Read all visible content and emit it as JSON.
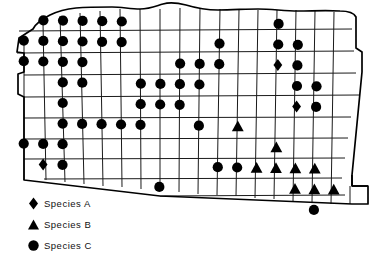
{
  "figure": {
    "kind": "species-distribution-map"
  },
  "legend": {
    "items": [
      {
        "symbol": "diamond",
        "label": "Species A"
      },
      {
        "symbol": "triangle",
        "label": "Species B"
      },
      {
        "symbol": "circle",
        "label": "Species C"
      }
    ]
  },
  "colors": {
    "symbol": "#000000",
    "grid": "#1a1a1a",
    "outline": "#000000",
    "background": "#ffffff"
  },
  "chart_data": {
    "type": "map",
    "title": "",
    "grid": {
      "columns": 17,
      "rows": 10
    },
    "symbol_key": {
      "diamond": "Species A",
      "triangle": "Species B",
      "circle": "Species C"
    },
    "markers": [
      {
        "row": 1,
        "col": 2,
        "symbol": "circle"
      },
      {
        "row": 1,
        "col": 3,
        "symbol": "circle"
      },
      {
        "row": 1,
        "col": 4,
        "symbol": "circle"
      },
      {
        "row": 1,
        "col": 5,
        "symbol": "circle"
      },
      {
        "row": 1,
        "col": 6,
        "symbol": "circle"
      },
      {
        "row": 1,
        "col": 14,
        "symbol": "circle"
      },
      {
        "row": 2,
        "col": 1,
        "symbol": "circle"
      },
      {
        "row": 2,
        "col": 2,
        "symbol": "circle"
      },
      {
        "row": 2,
        "col": 3,
        "symbol": "circle"
      },
      {
        "row": 2,
        "col": 4,
        "symbol": "circle"
      },
      {
        "row": 2,
        "col": 5,
        "symbol": "circle"
      },
      {
        "row": 2,
        "col": 6,
        "symbol": "circle"
      },
      {
        "row": 2,
        "col": 11,
        "symbol": "circle"
      },
      {
        "row": 2,
        "col": 14,
        "symbol": "circle"
      },
      {
        "row": 2,
        "col": 15,
        "symbol": "circle"
      },
      {
        "row": 3,
        "col": 1,
        "symbol": "circle"
      },
      {
        "row": 3,
        "col": 2,
        "symbol": "circle"
      },
      {
        "row": 3,
        "col": 3,
        "symbol": "circle"
      },
      {
        "row": 3,
        "col": 4,
        "symbol": "circle"
      },
      {
        "row": 3,
        "col": 9,
        "symbol": "circle"
      },
      {
        "row": 3,
        "col": 10,
        "symbol": "circle"
      },
      {
        "row": 3,
        "col": 11,
        "symbol": "circle"
      },
      {
        "row": 3,
        "col": 14,
        "symbol": "diamond"
      },
      {
        "row": 3,
        "col": 15,
        "symbol": "circle"
      },
      {
        "row": 4,
        "col": 3,
        "symbol": "circle"
      },
      {
        "row": 4,
        "col": 4,
        "symbol": "circle"
      },
      {
        "row": 4,
        "col": 7,
        "symbol": "circle"
      },
      {
        "row": 4,
        "col": 8,
        "symbol": "circle"
      },
      {
        "row": 4,
        "col": 9,
        "symbol": "circle"
      },
      {
        "row": 4,
        "col": 10,
        "symbol": "circle"
      },
      {
        "row": 4,
        "col": 15,
        "symbol": "circle"
      },
      {
        "row": 4,
        "col": 16,
        "symbol": "circle"
      },
      {
        "row": 5,
        "col": 3,
        "symbol": "circle"
      },
      {
        "row": 5,
        "col": 7,
        "symbol": "circle"
      },
      {
        "row": 5,
        "col": 8,
        "symbol": "circle"
      },
      {
        "row": 5,
        "col": 9,
        "symbol": "circle"
      },
      {
        "row": 5,
        "col": 15,
        "symbol": "diamond"
      },
      {
        "row": 5,
        "col": 16,
        "symbol": "circle"
      },
      {
        "row": 6,
        "col": 3,
        "symbol": "circle"
      },
      {
        "row": 6,
        "col": 4,
        "symbol": "circle"
      },
      {
        "row": 6,
        "col": 5,
        "symbol": "circle"
      },
      {
        "row": 6,
        "col": 6,
        "symbol": "circle"
      },
      {
        "row": 6,
        "col": 7,
        "symbol": "circle"
      },
      {
        "row": 6,
        "col": 10,
        "symbol": "circle"
      },
      {
        "row": 6,
        "col": 12,
        "symbol": "triangle"
      },
      {
        "row": 7,
        "col": 1,
        "symbol": "circle"
      },
      {
        "row": 7,
        "col": 2,
        "symbol": "circle"
      },
      {
        "row": 7,
        "col": 3,
        "symbol": "circle"
      },
      {
        "row": 7,
        "col": 14,
        "symbol": "triangle"
      },
      {
        "row": 8,
        "col": 2,
        "symbol": "diamond"
      },
      {
        "row": 8,
        "col": 3,
        "symbol": "circle"
      },
      {
        "row": 8,
        "col": 11,
        "symbol": "circle"
      },
      {
        "row": 8,
        "col": 12,
        "symbol": "circle"
      },
      {
        "row": 8,
        "col": 13,
        "symbol": "triangle"
      },
      {
        "row": 8,
        "col": 14,
        "symbol": "triangle"
      },
      {
        "row": 8,
        "col": 15,
        "symbol": "triangle"
      },
      {
        "row": 8,
        "col": 16,
        "symbol": "triangle"
      },
      {
        "row": 9,
        "col": 8,
        "symbol": "circle"
      },
      {
        "row": 9,
        "col": 15,
        "symbol": "triangle"
      },
      {
        "row": 9,
        "col": 16,
        "symbol": "triangle"
      },
      {
        "row": 9,
        "col": 17,
        "symbol": "triangle"
      },
      {
        "row": 10,
        "col": 16,
        "symbol": "circle"
      }
    ],
    "counts": {
      "Species A": 3,
      "Species B": 9,
      "Species C": 50
    }
  }
}
